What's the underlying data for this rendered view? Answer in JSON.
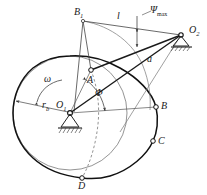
{
  "figure": {
    "type": "engineering-diagram",
    "colors": {
      "ink": "#1a1a1a",
      "thin_line": "#555555",
      "profile": "#111111",
      "background": "#ffffff"
    }
  },
  "labels": {
    "b1": "B",
    "b1_sub": "1",
    "link_l": "l",
    "psi_max": "Ψ",
    "psi_max_sub": "max",
    "o2": "O",
    "o2_sub": "2",
    "link_a": "a",
    "point_a": "A",
    "omega": "ω",
    "phi": "Φ",
    "base_radius": "r",
    "base_radius_sub": "b",
    "o1": "O",
    "o1_sub": "1",
    "point_b": "B",
    "point_c": "C",
    "point_d": "D"
  },
  "points": {
    "O1": {
      "x": 70,
      "y": 113
    },
    "O2": {
      "x": 183,
      "y": 34
    },
    "A": {
      "x": 91,
      "y": 70
    },
    "B": {
      "x": 156,
      "y": 107
    },
    "C": {
      "x": 153,
      "y": 141
    },
    "D": {
      "x": 82,
      "y": 178
    },
    "B1": {
      "x": 83,
      "y": 20
    }
  },
  "geometry": {
    "base_circle_center": {
      "x": 70,
      "y": 113
    },
    "base_circle_radius": 57,
    "cam_profile": "closed non-circular cam contour through A, B, C, D",
    "dashed_arc": "follower roller centre path from A to D"
  }
}
